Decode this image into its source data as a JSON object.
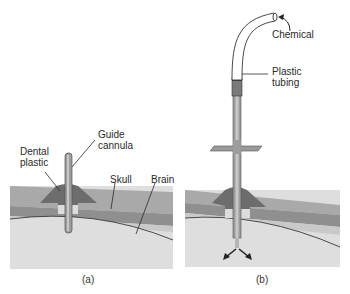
{
  "panels": [
    {
      "id": "a",
      "caption": "(a)",
      "labels": {
        "dental_plastic_line1": "Dental",
        "dental_plastic_line2": "plastic",
        "guide_cannula_line1": "Guide",
        "guide_cannula_line2": "cannula",
        "skull": "Skull",
        "brain": "Brain"
      }
    },
    {
      "id": "b",
      "caption": "(b)",
      "labels": {
        "chemical": "Chemical",
        "plastic_tubing_line1": "Plastic",
        "plastic_tubing_line2": "tubing"
      }
    }
  ],
  "colors": {
    "background": "#ffffff",
    "skull_outer": "#a9a9a9",
    "skull_inner": "#8c8c8c",
    "skull_gap": "#c4c4c4",
    "dental_plastic": "#6b6b6b",
    "brain": "#dedede",
    "brain_outline": "#3a3a3a",
    "cannula": "#9a9a9a",
    "tubing": "#ffffff",
    "leader_line": "#2a2a2a"
  }
}
